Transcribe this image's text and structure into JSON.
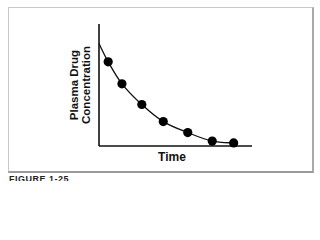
{
  "figure": {
    "caption": "FIGURE 1-25"
  },
  "chart_data": {
    "type": "line",
    "title": "",
    "xlabel": "Time",
    "ylabel": "Plasma Drug Concentration",
    "ylabel_lines": [
      "Plasma Drug",
      "Concentration"
    ],
    "grid": false,
    "legend": null,
    "x_ticks": [],
    "y_ticks": [],
    "curve_start": {
      "x": 0,
      "y": 0.84
    },
    "x": [
      0.06,
      0.15,
      0.28,
      0.42,
      0.58,
      0.74,
      0.88
    ],
    "values": [
      0.69,
      0.51,
      0.34,
      0.2,
      0.11,
      0.04,
      0.025
    ],
    "xlim": [
      0,
      1
    ],
    "ylim": [
      0,
      1
    ],
    "colors": {
      "line": "#111111",
      "markers": "#000000",
      "axes": "#111111"
    }
  }
}
